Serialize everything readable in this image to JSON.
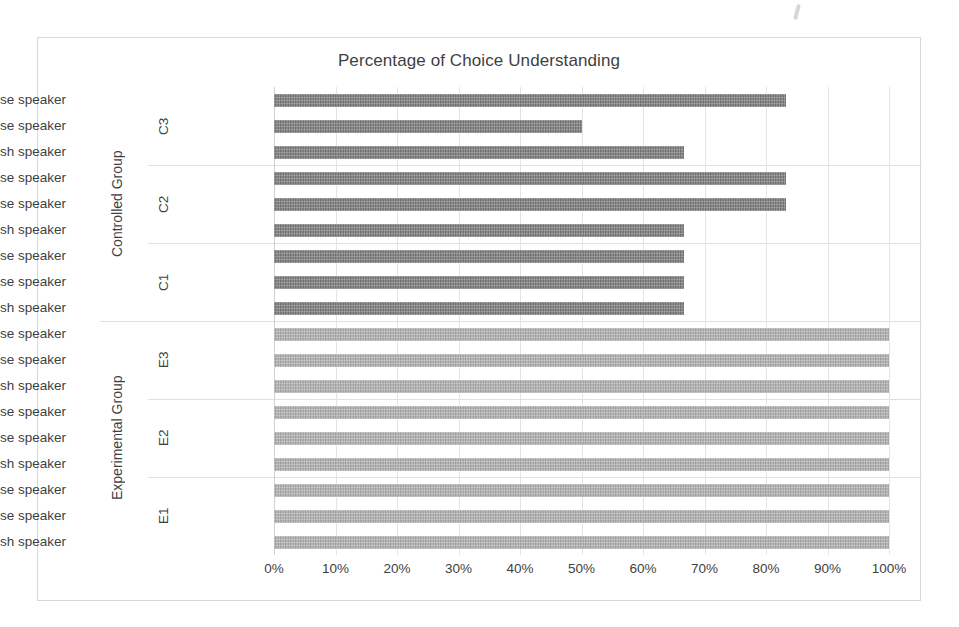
{
  "chart": {
    "title": "Percentage of Choice Understanding",
    "axis_unit_suffix": "%",
    "group_axis_labels": [
      "Controlled Group",
      "Experimental Group"
    ],
    "colors": {
      "controlled_bar": "#7d7d7d",
      "experimental_bar": "#b2b2b2",
      "gridline": "#e4e4e4",
      "border": "#d8d8d8",
      "text": "#3f3f3f",
      "background": "#ffffff"
    }
  },
  "chart_data": {
    "type": "bar",
    "orientation": "horizontal",
    "title": "Percentage of Choice Understanding",
    "xlabel": "",
    "ylabel": "",
    "xlim": [
      0,
      100
    ],
    "grid": true,
    "legend": "none",
    "tick_labels": [
      "0%",
      "10%",
      "20%",
      "30%",
      "40%",
      "50%",
      "60%",
      "70%",
      "80%",
      "90%",
      "100%"
    ],
    "tick_values": [
      0,
      10,
      20,
      30,
      40,
      50,
      60,
      70,
      80,
      90,
      100
    ],
    "groups": [
      {
        "name": "Controlled Group",
        "color": "#7d7d7d",
        "subgroups": [
          {
            "name": "C3",
            "bars": [
              {
                "category": "Chinese speaker",
                "value": 83.3
              },
              {
                "category": "Japanese speaker",
                "value": 50.0
              },
              {
                "category": "English speaker",
                "value": 66.7
              }
            ]
          },
          {
            "name": "C2",
            "bars": [
              {
                "category": "Chinese speaker",
                "value": 83.3
              },
              {
                "category": "Japanese speaker",
                "value": 83.3
              },
              {
                "category": "English speaker",
                "value": 66.7
              }
            ]
          },
          {
            "name": "C1",
            "bars": [
              {
                "category": "Chinese speaker",
                "value": 66.7
              },
              {
                "category": "Japanese speaker",
                "value": 66.7
              },
              {
                "category": "English speaker",
                "value": 66.7
              }
            ]
          }
        ]
      },
      {
        "name": "Experimental Group",
        "color": "#b2b2b2",
        "subgroups": [
          {
            "name": "E3",
            "bars": [
              {
                "category": "Chinese speaker",
                "value": 100
              },
              {
                "category": "Japanese speaker",
                "value": 100
              },
              {
                "category": "English speaker",
                "value": 100
              }
            ]
          },
          {
            "name": "E2",
            "bars": [
              {
                "category": "Chinese speaker",
                "value": 100
              },
              {
                "category": "Japanese speaker",
                "value": 100
              },
              {
                "category": "English speaker",
                "value": 100
              }
            ]
          },
          {
            "name": "E1",
            "bars": [
              {
                "category": "Chinese speaker",
                "value": 100
              },
              {
                "category": "Japanese speaker",
                "value": 100
              },
              {
                "category": "English speaker",
                "value": 100
              }
            ]
          }
        ]
      }
    ]
  }
}
